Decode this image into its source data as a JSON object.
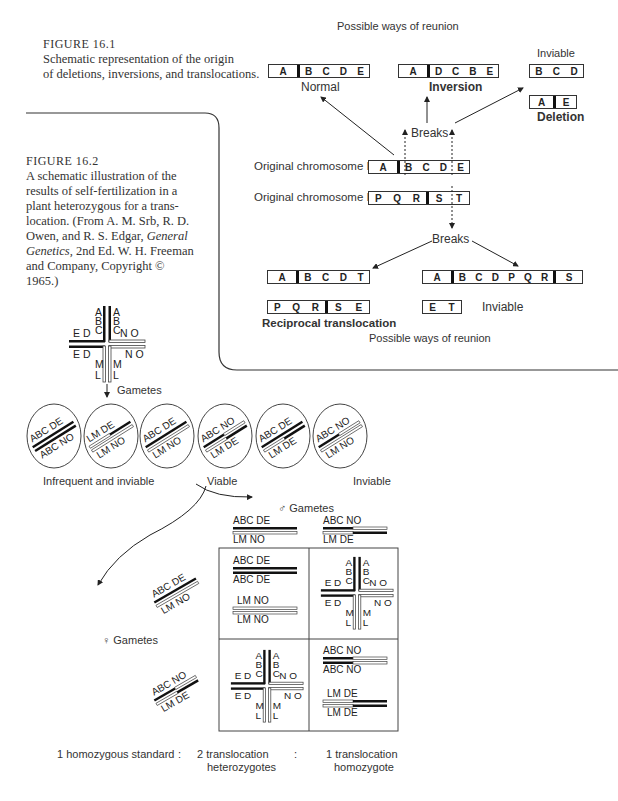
{
  "figure_16_1": {
    "label": "FIGURE 16.1",
    "caption": "Schematic representation of the origin of deletions, inversions, and translocations.",
    "caption_line1": "Schematic representation of the origin",
    "caption_line2": "of deletions, inversions, and translocations.",
    "top_heading": "Possible ways of reunion",
    "bottom_heading": "Possible ways of reunion",
    "breaks_upper": "Breaks",
    "breaks_lower": "Breaks",
    "original_chromosome_I": {
      "label": "Original chromosome I",
      "left": [
        "A"
      ],
      "right": [
        "B",
        "C",
        "D",
        "E"
      ]
    },
    "original_chromosome_II": {
      "label": "Original chromosome II",
      "left": [
        "P",
        "Q",
        "R"
      ],
      "right": [
        "S",
        "T"
      ]
    },
    "outcomes_upper": [
      {
        "name": "Normal",
        "left": [
          "A"
        ],
        "right": [
          "B",
          "C",
          "D",
          "E"
        ]
      },
      {
        "name": "Inversion",
        "left": [
          "A"
        ],
        "right": [
          "D",
          "C",
          "B",
          "E"
        ]
      },
      {
        "name": "Inviable",
        "segment": [
          "B",
          "C",
          "D"
        ]
      },
      {
        "name": "Deletion",
        "left": [
          "A"
        ],
        "right": [
          "E"
        ]
      }
    ],
    "outcomes_lower": [
      {
        "chromosome": {
          "left": [
            "A"
          ],
          "right": [
            "B",
            "C",
            "D",
            "T"
          ]
        }
      },
      {
        "chromosome": {
          "left": [
            "P",
            "Q",
            "R"
          ],
          "right": [
            "S",
            "E"
          ]
        },
        "name": "Reciprocal translocation"
      },
      {
        "chromosome": {
          "left": [
            "A"
          ],
          "middle": [
            "B",
            "C",
            "D",
            "P",
            "Q",
            "R"
          ],
          "right": [
            "S"
          ]
        }
      },
      {
        "segment": [
          "E",
          "T"
        ],
        "name": "Inviable"
      }
    ]
  },
  "figure_16_2": {
    "label": "FIGURE 16.2",
    "caption_lines": [
      "A schematic illustration of the",
      "results of self-fertilization in a",
      "plant heterozygous for a trans-",
      "location. (From A. M. Srb, R. D.",
      "Owen, and R. S. Edgar, ",
      "Genetics,",
      " 2nd Ed. W. H. Freeman",
      "and Company, Copyright ©",
      "1965.)"
    ],
    "caption_italic_1": "General",
    "gametes_label": "Gametes",
    "gametes": [
      {
        "top": "ABC  DE",
        "bottom": "ABC  NO"
      },
      {
        "top": "LM  DE",
        "bottom": "LM  NO"
      },
      {
        "top": "ABC  DE",
        "bottom": "LM  NO"
      },
      {
        "top": "ABC  NO",
        "bottom": "LM  DE"
      },
      {
        "top": "ABC  DE",
        "bottom": "LM  DE"
      },
      {
        "top": "ABC  NO",
        "bottom": "LM  NO"
      }
    ],
    "group_labels": {
      "infrequent": "Infrequent and inviable",
      "viable": "Viable",
      "inviable": "Inviable"
    },
    "male_gametes_label": "♂ Gametes",
    "female_gametes_label": "♀ Gametes",
    "male_gametes": [
      {
        "top": "ABC  DE",
        "bottom": "LM  NO"
      },
      {
        "top": "ABC  NO",
        "bottom": "LM  DE"
      }
    ],
    "female_gametes": [
      {
        "top": "ABC  DE",
        "bottom": "LM  NO"
      },
      {
        "top": "ABC  NO",
        "bottom": "LM  DE"
      }
    ],
    "punnett": {
      "cell_11": {
        "pairs": [
          [
            "ABC  DE",
            "ABC  DE"
          ],
          [
            "LM  NO",
            "LM  NO"
          ]
        ]
      },
      "cell_12": {
        "type": "cross"
      },
      "cell_21": {
        "type": "cross"
      },
      "cell_22": {
        "pairs": [
          [
            "ABC  NO",
            "ABC  NO"
          ],
          [
            "LM  DE",
            "LM  DE"
          ]
        ]
      }
    },
    "cross_labels": {
      "A": "A",
      "B": "B",
      "C": "C",
      "D": "D",
      "E": "E",
      "L": "L",
      "M": "M",
      "N": "N",
      "O": "O",
      "ED": "E D",
      "NO": "N O"
    },
    "ratio": {
      "standard": "1 homozygous standard",
      "sep1": ":",
      "hetero_1": "2 translocation",
      "hetero_2": "heterozygotes",
      "sep2": ":",
      "homo_1": "1 translocation",
      "homo_2": "homozygote"
    }
  }
}
